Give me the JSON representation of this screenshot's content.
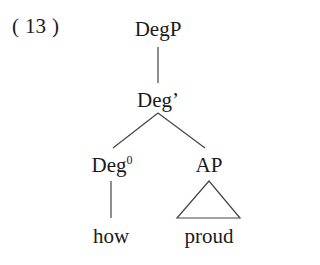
{
  "example": {
    "number": "13",
    "open_paren": "(",
    "close_paren": ")"
  },
  "tree": {
    "root": {
      "label": "DegP"
    },
    "bar": {
      "label": "Deg’"
    },
    "head": {
      "label": "Deg",
      "superscript": "0",
      "terminal": "how"
    },
    "complement": {
      "label": "AP",
      "terminal": "proud",
      "triangle": true
    }
  },
  "colors": {
    "text": "#1a1a1a",
    "lines": "#444444",
    "background": "#ffffff"
  }
}
